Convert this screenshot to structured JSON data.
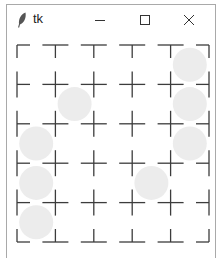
{
  "window": {
    "title": "tk",
    "icon": "feather-icon",
    "controls": [
      {
        "name": "minimize",
        "icon": "minimize-icon",
        "glyph": "—"
      },
      {
        "name": "maximize",
        "icon": "maximize-icon",
        "glyph": "☐"
      },
      {
        "name": "close",
        "icon": "close-icon",
        "glyph": "✕"
      }
    ]
  },
  "board": {
    "columns": 6,
    "rows": 6,
    "line_color": "#3c3c3c",
    "stone_color": "#ececec",
    "stones": [
      {
        "col": 4,
        "row": 0
      },
      {
        "col": 4,
        "row": 1
      },
      {
        "col": 4,
        "row": 2
      },
      {
        "col": 1,
        "row": 1
      },
      {
        "col": 0,
        "row": 2
      },
      {
        "col": 0,
        "row": 3
      },
      {
        "col": 0,
        "row": 4
      },
      {
        "col": 3,
        "row": 3
      }
    ]
  }
}
